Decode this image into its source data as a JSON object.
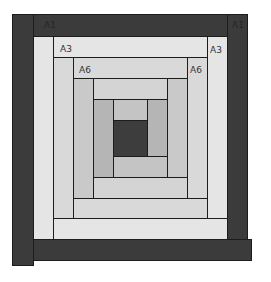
{
  "diagram": {
    "colors": {
      "outer_dark": "#3b3b3b",
      "ring_a3": "#e5e5e5",
      "ring_a6": "#d9d9d9",
      "ring_3": "#c9c9c9",
      "ring_4": "#b5b5b5",
      "center": "#3d3d3d",
      "outline": "#1c1c1c"
    },
    "labels": {
      "top_left_outer": "A1",
      "top_right_outer": "A1",
      "top_left_a3": "A3",
      "top_right_a3": "A3",
      "top_left_a6": "A6",
      "top_right_a6": "A6"
    }
  }
}
